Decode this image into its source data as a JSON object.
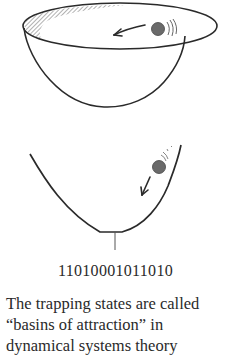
{
  "figure": {
    "top_diagram": {
      "description": "Hemispherical bowl viewed from above-side with a ball rolling along the rim",
      "ball_color": "#6a6a6a",
      "stroke_color": "#2a2a2a",
      "arrow_direction": "counter-clockwise along rim (leftward)"
    },
    "bottom_diagram": {
      "description": "Cross-section of a U-shaped basin with a ball rolling down the right slope",
      "ball_color": "#6a6a6a",
      "stroke_color": "#2a2a2a",
      "arrow_direction": "down-left toward bottom"
    },
    "binary_string": "11010001011010",
    "caption": {
      "lines": [
        "The trapping  states are called",
        "“basins of attraction” in",
        "dynamical  systems  theory"
      ]
    }
  }
}
